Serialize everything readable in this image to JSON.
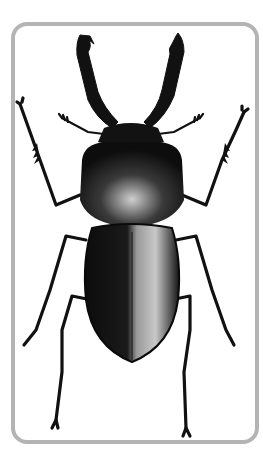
{
  "image": {
    "subject": "stag beetle",
    "description": "Black-and-white photograph of a stag beetle, dorsal view, inside a rounded gray frame",
    "frame_color": "#b4b4b4",
    "background_color": "#ffffff",
    "beetle_color": "#111111"
  }
}
